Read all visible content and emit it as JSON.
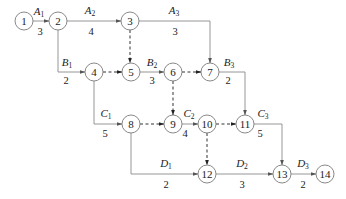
{
  "diagram": {
    "type": "activity-on-arrow network",
    "nodes": [
      {
        "id": "1",
        "x": 24,
        "y": 21
      },
      {
        "id": "2",
        "x": 58,
        "y": 21
      },
      {
        "id": "3",
        "x": 130,
        "y": 21
      },
      {
        "id": "4",
        "x": 94,
        "y": 72
      },
      {
        "id": "5",
        "x": 131,
        "y": 72
      },
      {
        "id": "6",
        "x": 173,
        "y": 72
      },
      {
        "id": "7",
        "x": 210,
        "y": 72
      },
      {
        "id": "8",
        "x": 131,
        "y": 124
      },
      {
        "id": "9",
        "x": 173,
        "y": 124
      },
      {
        "id": "10",
        "x": 207,
        "y": 124
      },
      {
        "id": "11",
        "x": 245,
        "y": 124
      },
      {
        "id": "12",
        "x": 207,
        "y": 174
      },
      {
        "id": "13",
        "x": 282,
        "y": 174
      },
      {
        "id": "14",
        "x": 325,
        "y": 174
      }
    ],
    "activities": [
      {
        "name": "A",
        "sub": "1",
        "duration": "3",
        "from": "1",
        "to": "2"
      },
      {
        "name": "A",
        "sub": "2",
        "duration": "4",
        "from": "2",
        "to": "3"
      },
      {
        "name": "A",
        "sub": "3",
        "duration": "3",
        "from": "3",
        "to": "7"
      },
      {
        "name": "B",
        "sub": "1",
        "duration": "2",
        "from": "2",
        "to": "4"
      },
      {
        "name": "B",
        "sub": "2",
        "duration": "3",
        "from": "5",
        "to": "6"
      },
      {
        "name": "B",
        "sub": "3",
        "duration": "2",
        "from": "7",
        "to": "11"
      },
      {
        "name": "C",
        "sub": "1",
        "duration": "5",
        "from": "4",
        "to": "8"
      },
      {
        "name": "C",
        "sub": "2",
        "duration": "4",
        "from": "9",
        "to": "10"
      },
      {
        "name": "C",
        "sub": "3",
        "duration": "5",
        "from": "11",
        "to": "13"
      },
      {
        "name": "D",
        "sub": "1",
        "duration": "2",
        "from": "8",
        "to": "12"
      },
      {
        "name": "D",
        "sub": "2",
        "duration": "3",
        "from": "12",
        "to": "13"
      },
      {
        "name": "D",
        "sub": "3",
        "duration": "2",
        "from": "13",
        "to": "14"
      }
    ],
    "dummies": [
      {
        "from": "3",
        "to": "5"
      },
      {
        "from": "4",
        "to": "5"
      },
      {
        "from": "6",
        "to": "7"
      },
      {
        "from": "6",
        "to": "9"
      },
      {
        "from": "8",
        "to": "9"
      },
      {
        "from": "10",
        "to": "11"
      },
      {
        "from": "10",
        "to": "12"
      }
    ]
  },
  "labels": {
    "n1": "1",
    "n2": "2",
    "n3": "3",
    "n4": "4",
    "n5": "5",
    "n6": "6",
    "n7": "7",
    "n8": "8",
    "n9": "9",
    "n10": "10",
    "n11": "11",
    "n12": "12",
    "n13": "13",
    "n14": "14",
    "A1": {
      "name": "A",
      "sub": "1",
      "dur": "3"
    },
    "A2": {
      "name": "A",
      "sub": "2",
      "dur": "4"
    },
    "A3": {
      "name": "A",
      "sub": "3",
      "dur": "3"
    },
    "B1": {
      "name": "B",
      "sub": "1",
      "dur": "2"
    },
    "B2": {
      "name": "B",
      "sub": "2",
      "dur": "3"
    },
    "B3": {
      "name": "B",
      "sub": "3",
      "dur": "2"
    },
    "C1": {
      "name": "C",
      "sub": "1",
      "dur": "5"
    },
    "C2": {
      "name": "C",
      "sub": "2",
      "dur": "4"
    },
    "C3": {
      "name": "C",
      "sub": "3",
      "dur": "5"
    },
    "D1": {
      "name": "D",
      "sub": "1",
      "dur": "2"
    },
    "D2": {
      "name": "D",
      "sub": "2",
      "dur": "3"
    },
    "D3": {
      "name": "D",
      "sub": "3",
      "dur": "2"
    }
  }
}
